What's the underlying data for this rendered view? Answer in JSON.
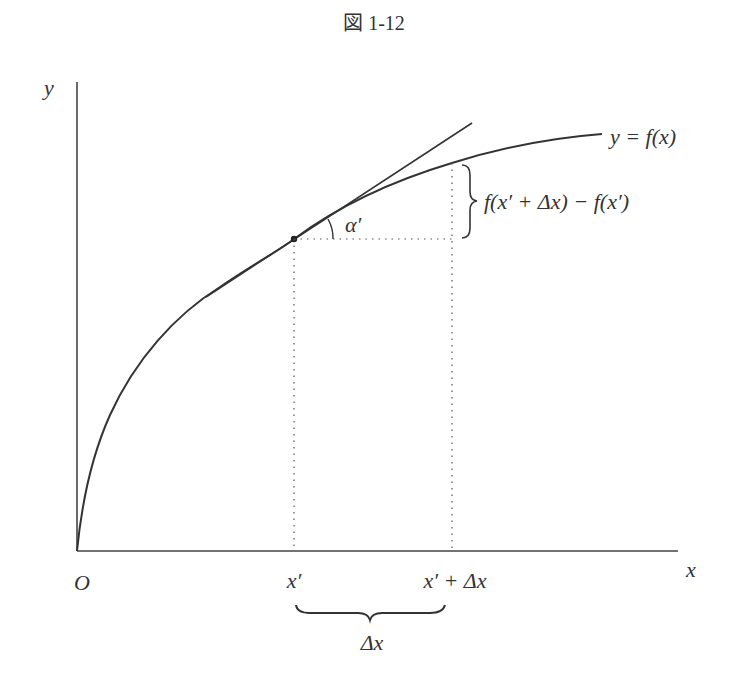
{
  "figure": {
    "title": "図 1-12",
    "axes": {
      "x_label": "x",
      "y_label": "y",
      "origin_label": "O"
    },
    "curve_label": "y = f(x)",
    "difference_label": "f(x′ + Δx) − f(x′)",
    "angle_label": "α′",
    "tick_labels": {
      "x_prime": "x′",
      "x_prime_plus_dx": "x′ + Δx"
    },
    "brace_label": "Δx",
    "colors": {
      "stroke": "#333333",
      "background": "#ffffff"
    }
  }
}
